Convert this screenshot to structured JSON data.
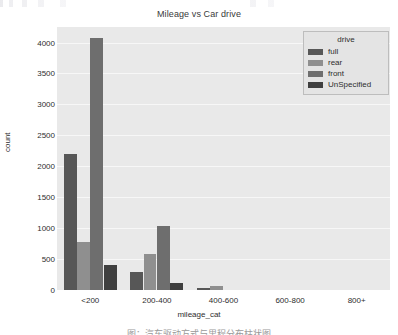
{
  "chart_data": {
    "type": "bar",
    "title": "Mileage vs Car drive",
    "xlabel": "mileage_cat",
    "ylabel": "count",
    "categories": [
      "<200",
      "200-400",
      "400-600",
      "600-800",
      "800+"
    ],
    "ylim": [
      0,
      4250
    ],
    "yticks": [
      0,
      500,
      1000,
      1500,
      2000,
      2500,
      3000,
      3500,
      4000
    ],
    "grid": true,
    "legend_title": "drive",
    "legend_position": "upper right",
    "series": [
      {
        "name": "full",
        "color": "#575757",
        "values": [
          2200,
          290,
          30,
          0,
          0
        ]
      },
      {
        "name": "rear",
        "color": "#8f8f8f",
        "values": [
          770,
          580,
          60,
          0,
          0
        ]
      },
      {
        "name": "front",
        "color": "#6e6e6e",
        "values": [
          4080,
          1040,
          0,
          0,
          0
        ]
      },
      {
        "name": "UnSpecified",
        "color": "#3f3f3f",
        "values": [
          400,
          110,
          0,
          0,
          0
        ]
      }
    ]
  },
  "caption": {
    "text": "图：汽车驱动方式与里程分布柱状图"
  },
  "colors": {
    "plot_background": "#e9e9e9",
    "gridline": "#f7f7f7",
    "legend_background": "#e4e4e4",
    "legend_border": "#bdbdbd",
    "text": "#2e2e2e"
  }
}
